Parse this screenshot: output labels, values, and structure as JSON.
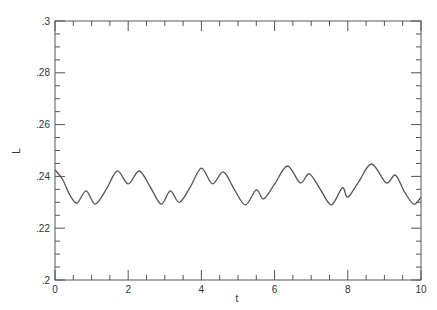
{
  "chart_data": {
    "type": "line",
    "title": "",
    "xlabel": "t",
    "ylabel": "L",
    "xlim": [
      0,
      10
    ],
    "ylim": [
      0.2,
      0.3
    ],
    "grid": false,
    "legend": null,
    "x_ticks": [
      0,
      2,
      4,
      6,
      8,
      10
    ],
    "x_tick_labels": [
      "0",
      "2",
      "4",
      "6",
      "8",
      "10"
    ],
    "y_ticks": [
      0.2,
      0.22,
      0.24,
      0.26,
      0.28,
      0.3
    ],
    "y_tick_labels": [
      ".2",
      ".22",
      ".24",
      ".26",
      ".28",
      ".3"
    ],
    "series": [
      {
        "name": "L(t)",
        "color": "#555555",
        "x": [
          0,
          0.2,
          0.4,
          0.6,
          0.85,
          1.1,
          1.4,
          1.7,
          2.0,
          2.3,
          2.6,
          2.9,
          3.15,
          3.4,
          3.7,
          4.0,
          4.3,
          4.6,
          4.9,
          5.2,
          5.5,
          5.7,
          6.0,
          6.35,
          6.7,
          6.95,
          7.25,
          7.55,
          7.85,
          8.0,
          8.3,
          8.65,
          9.05,
          9.3,
          9.55,
          9.8,
          10.0
        ],
        "values": [
          0.2425,
          0.239,
          0.233,
          0.2297,
          0.2344,
          0.2293,
          0.235,
          0.2421,
          0.2371,
          0.2421,
          0.236,
          0.2293,
          0.2344,
          0.23,
          0.236,
          0.2432,
          0.2371,
          0.2417,
          0.235,
          0.229,
          0.2348,
          0.2313,
          0.237,
          0.244,
          0.2375,
          0.241,
          0.235,
          0.229,
          0.2356,
          0.232,
          0.238,
          0.2448,
          0.2375,
          0.2405,
          0.234,
          0.2293,
          0.232
        ]
      }
    ]
  }
}
